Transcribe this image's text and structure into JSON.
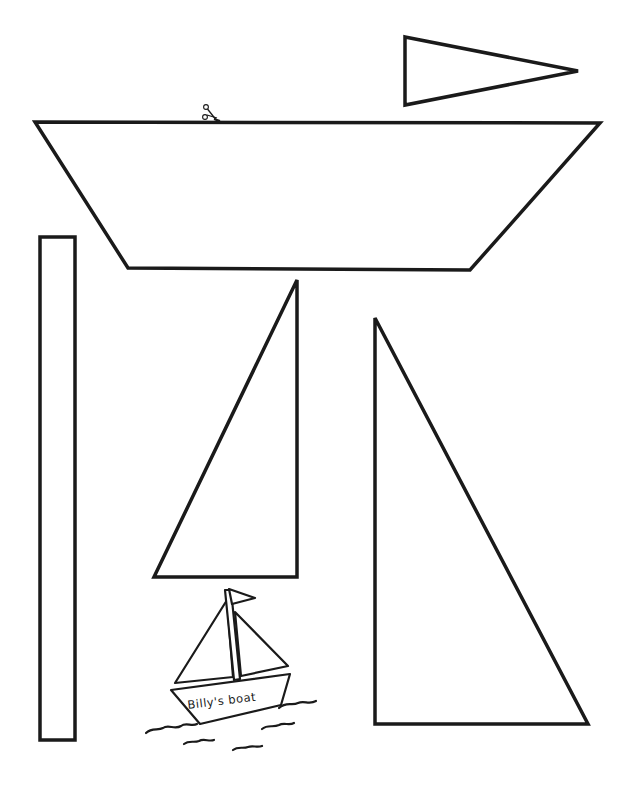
{
  "page": {
    "type": "craft-cutout-template",
    "background": "#ffffff",
    "line_color": "#1a1a1a"
  },
  "pieces": [
    {
      "id": "pennant-flag",
      "shape": "triangle",
      "points": [
        [
          405,
          37
        ],
        [
          578,
          71
        ],
        [
          405,
          105
        ]
      ]
    },
    {
      "id": "boat-hull",
      "shape": "trapezoid",
      "points": [
        [
          35,
          122
        ],
        [
          600,
          123
        ],
        [
          470,
          270
        ],
        [
          128,
          268
        ]
      ]
    },
    {
      "id": "mast",
      "shape": "rectangle",
      "x": 40,
      "y": 237,
      "width": 35,
      "height": 503
    },
    {
      "id": "small-sail",
      "shape": "triangle",
      "points": [
        [
          297,
          280
        ],
        [
          297,
          577
        ],
        [
          154,
          577
        ]
      ]
    },
    {
      "id": "large-sail",
      "shape": "triangle",
      "points": [
        [
          375,
          318
        ],
        [
          375,
          724
        ],
        [
          588,
          724
        ]
      ]
    }
  ],
  "cut_marker": {
    "icon": "scissors-icon",
    "x": 207,
    "y": 113
  },
  "example": {
    "label": "Billy's boat",
    "description": "Finished sailboat example sketch"
  }
}
